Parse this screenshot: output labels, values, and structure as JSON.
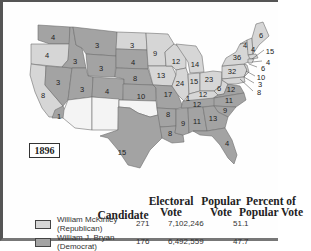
{
  "year": "1896",
  "colors": {
    "republican": "#d6d6d6",
    "democrat": "#a3a3a3",
    "territory": "#f4f4f4",
    "border": "#6e6e6e"
  },
  "legend": {
    "headers": {
      "candidate": "Candidate",
      "electoral_vote": "Electoral Vote",
      "popular_vote": "Popular Vote",
      "percent": "Percent of Popular Vote"
    },
    "rows": [
      {
        "name": "William McKinley",
        "party": "(Republican)",
        "electoral": "271",
        "popular": "7,102,246",
        "percent": "51.1",
        "color": "#d6d6d6"
      },
      {
        "name": "William J. Bryan",
        "party": "(Democrat)",
        "electoral": "176",
        "popular": "6,492,559",
        "percent": "47.7",
        "color": "#a3a3a3"
      }
    ]
  },
  "states": [
    {
      "label": "4",
      "x": 53,
      "y": 37,
      "party": "D",
      "name": "WA"
    },
    {
      "label": "4",
      "x": 47,
      "y": 55,
      "party": "R",
      "name": "OR"
    },
    {
      "label": "8",
      "x": 43,
      "y": 95,
      "party": "R",
      "name": "CA"
    },
    {
      "label": "1",
      "x": 59,
      "y": 116,
      "party": "D",
      "name": "CA-split"
    },
    {
      "label": "3",
      "x": 58,
      "y": 82,
      "party": "D",
      "name": "NV"
    },
    {
      "label": "3",
      "x": 75,
      "y": 61,
      "party": "D",
      "name": "ID"
    },
    {
      "label": "3",
      "x": 97,
      "y": 45,
      "party": "D",
      "name": "MT"
    },
    {
      "label": "3",
      "x": 101,
      "y": 68,
      "party": "D",
      "name": "WY"
    },
    {
      "label": "3",
      "x": 82,
      "y": 89,
      "party": "D",
      "name": "UT"
    },
    {
      "label": "4",
      "x": 107,
      "y": 91,
      "party": "D",
      "name": "CO"
    },
    {
      "label": "3",
      "x": 132,
      "y": 45,
      "party": "R",
      "name": "ND"
    },
    {
      "label": "4",
      "x": 133,
      "y": 62,
      "party": "D",
      "name": "SD"
    },
    {
      "label": "8",
      "x": 135,
      "y": 78,
      "party": "D",
      "name": "NE"
    },
    {
      "label": "10",
      "x": 141,
      "y": 96,
      "party": "D",
      "name": "KS"
    },
    {
      "label": "15",
      "x": 122,
      "y": 152,
      "party": "D",
      "name": "TX"
    },
    {
      "label": "9",
      "x": 155,
      "y": 53,
      "party": "R",
      "name": "MN"
    },
    {
      "label": "13",
      "x": 161,
      "y": 75,
      "party": "R",
      "name": "IA"
    },
    {
      "label": "17",
      "x": 168,
      "y": 94,
      "party": "D",
      "name": "MO"
    },
    {
      "label": "8",
      "x": 168,
      "y": 114,
      "party": "D",
      "name": "AR"
    },
    {
      "label": "8",
      "x": 170,
      "y": 133,
      "party": "D",
      "name": "LA"
    },
    {
      "label": "12",
      "x": 176,
      "y": 61,
      "party": "R",
      "name": "WI"
    },
    {
      "label": "14",
      "x": 195,
      "y": 64,
      "party": "R",
      "name": "MI"
    },
    {
      "label": "24",
      "x": 180,
      "y": 83,
      "party": "R",
      "name": "IL"
    },
    {
      "label": "15",
      "x": 194,
      "y": 81,
      "party": "R",
      "name": "IN"
    },
    {
      "label": "23",
      "x": 209,
      "y": 79,
      "party": "R",
      "name": "OH"
    },
    {
      "label": "12",
      "x": 203,
      "y": 94,
      "party": "R",
      "name": "KY"
    },
    {
      "label": "1",
      "x": 188,
      "y": 98,
      "party": "D",
      "name": "KY-split"
    },
    {
      "label": "6",
      "x": 219,
      "y": 88,
      "party": "R",
      "name": "WV"
    },
    {
      "label": "12",
      "x": 231,
      "y": 89,
      "party": "D",
      "name": "VA"
    },
    {
      "label": "11",
      "x": 229,
      "y": 100,
      "party": "D",
      "name": "NC"
    },
    {
      "label": "12",
      "x": 197,
      "y": 104,
      "party": "D",
      "name": "TN"
    },
    {
      "label": "9",
      "x": 183,
      "y": 123,
      "party": "D",
      "name": "MS"
    },
    {
      "label": "11",
      "x": 197,
      "y": 121,
      "party": "D",
      "name": "AL"
    },
    {
      "label": "13",
      "x": 213,
      "y": 118,
      "party": "D",
      "name": "GA"
    },
    {
      "label": "9",
      "x": 225,
      "y": 110,
      "party": "D",
      "name": "SC"
    },
    {
      "label": "4",
      "x": 227,
      "y": 143,
      "party": "D",
      "name": "FL"
    },
    {
      "label": "36",
      "x": 237,
      "y": 57,
      "party": "R",
      "name": "NY"
    },
    {
      "label": "32",
      "x": 232,
      "y": 71,
      "party": "R",
      "name": "PA"
    },
    {
      "label": "6",
      "x": 261,
      "y": 35,
      "party": "R",
      "name": "ME"
    },
    {
      "label": "4",
      "x": 245,
      "y": 45,
      "party": "R",
      "name": "VT"
    },
    {
      "label": "4",
      "x": 253,
      "y": 49,
      "party": "R",
      "name": "NH"
    }
  ],
  "callouts": [
    {
      "label": "15",
      "x": 268,
      "y": 51,
      "lx": 252,
      "ly": 59,
      "name": "MA"
    },
    {
      "label": "4",
      "x": 266,
      "y": 62,
      "lx": 252,
      "ly": 62,
      "name": "RI"
    },
    {
      "label": "6",
      "x": 261,
      "y": 68,
      "lx": 249,
      "ly": 64,
      "name": "CT"
    },
    {
      "label": "10",
      "x": 259,
      "y": 77,
      "lx": 246,
      "ly": 71,
      "name": "NJ"
    },
    {
      "label": "3",
      "x": 258,
      "y": 84,
      "lx": 244,
      "ly": 77,
      "name": "DE"
    },
    {
      "label": "8",
      "x": 257,
      "y": 92,
      "lx": 240,
      "ly": 79,
      "name": "MD"
    }
  ]
}
